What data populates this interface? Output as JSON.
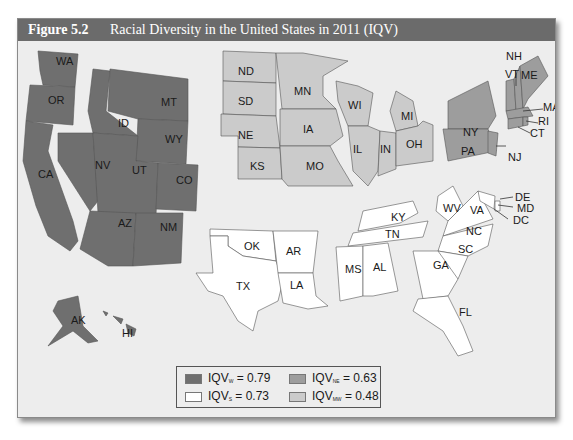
{
  "figure": {
    "number": "Figure 5.2",
    "title": "Racial Diversity in the United States in 2011 (IQV)"
  },
  "colors": {
    "west": "#6f6f6f",
    "south": "#ffffff",
    "northeast": "#9d9d9d",
    "midwest": "#cbcbcb",
    "background": "#ededed",
    "header": "#6b6b6b"
  },
  "legend": [
    {
      "region": "W",
      "label_prefix": "IQV",
      "subscript": "W",
      "value_text": " = 0.79",
      "color": "#6f6f6f"
    },
    {
      "region": "NE",
      "label_prefix": "IQV",
      "subscript": "NE",
      "value_text": " = 0.63",
      "color": "#9d9d9d"
    },
    {
      "region": "S",
      "label_prefix": "IQV",
      "subscript": "S",
      "value_text": " = 0.73",
      "color": "#ffffff"
    },
    {
      "region": "MW",
      "label_prefix": "IQV",
      "subscript": "MW",
      "value_text": " = 0.48",
      "color": "#cbcbcb"
    }
  ],
  "regions": {
    "west": {
      "iqv": 0.79,
      "states": [
        "WA",
        "OR",
        "CA",
        "ID",
        "NV",
        "MT",
        "WY",
        "UT",
        "CO",
        "AZ",
        "NM",
        "AK",
        "HI"
      ]
    },
    "midwest": {
      "iqv": 0.48,
      "states": [
        "ND",
        "SD",
        "NE",
        "KS",
        "MN",
        "IA",
        "MO",
        "WI",
        "IL",
        "IN",
        "MI",
        "OH"
      ]
    },
    "northeast": {
      "iqv": 0.63,
      "states": [
        "NY",
        "PA",
        "NJ",
        "VT",
        "NH",
        "ME",
        "MA",
        "RI",
        "CT"
      ]
    },
    "south": {
      "iqv": 0.73,
      "states": [
        "OK",
        "TX",
        "AR",
        "LA",
        "KY",
        "TN",
        "MS",
        "AL",
        "WV",
        "VA",
        "NC",
        "SC",
        "GA",
        "FL",
        "DE",
        "MD",
        "DC"
      ]
    }
  },
  "labels": {
    "WA": "WA",
    "OR": "OR",
    "CA": "CA",
    "ID": "ID",
    "NV": "NV",
    "MT": "MT",
    "WY": "WY",
    "UT": "UT",
    "CO": "CO",
    "AZ": "AZ",
    "NM": "NM",
    "AK": "AK",
    "HI": "HI",
    "ND": "ND",
    "SD": "SD",
    "NE": "NE",
    "KS": "KS",
    "MN": "MN",
    "IA": "IA",
    "MO": "MO",
    "WI": "WI",
    "IL": "IL",
    "IN": "IN",
    "MI": "MI",
    "OH": "OH",
    "NY": "NY",
    "PA": "PA",
    "NJ": "NJ",
    "VT": "VT",
    "NH": "NH",
    "ME": "ME",
    "MA": "MA",
    "RI": "RI",
    "CT": "CT",
    "OK": "OK",
    "TX": "TX",
    "AR": "AR",
    "LA": "LA",
    "KY": "KY",
    "TN": "TN",
    "MS": "MS",
    "AL": "AL",
    "WV": "WV",
    "VA": "VA",
    "NC": "NC",
    "SC": "SC",
    "GA": "GA",
    "FL": "FL",
    "DE": "DE",
    "MD": "MD",
    "DC": "DC"
  }
}
